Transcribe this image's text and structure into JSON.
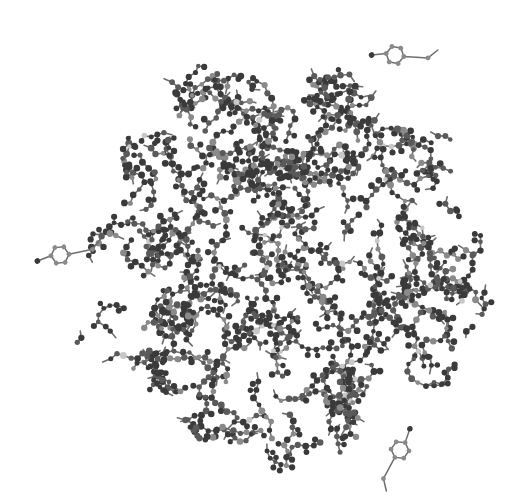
{
  "image": {
    "subject": "ball-and-stick molecular model of a globular protein",
    "width": 531,
    "height": 503,
    "background": "#ffffff",
    "palette": {
      "bond": "#6e6e6e",
      "atom_dark": "#3a3a3a",
      "atom_mid": "#5a5a5a",
      "atom_light": "#8a8a8a",
      "atom_pale": "#c8c8c8"
    },
    "cluster": {
      "center_x": 282,
      "center_y": 258,
      "radius_x": 205,
      "radius_y": 200,
      "atom_count": 1900,
      "seed": 7
    },
    "protruding_rings": [
      {
        "x": 60,
        "y": 255,
        "angle": -35
      },
      {
        "x": 395,
        "y": 55,
        "angle": -20
      },
      {
        "x": 400,
        "y": 450,
        "angle": 95
      }
    ]
  }
}
